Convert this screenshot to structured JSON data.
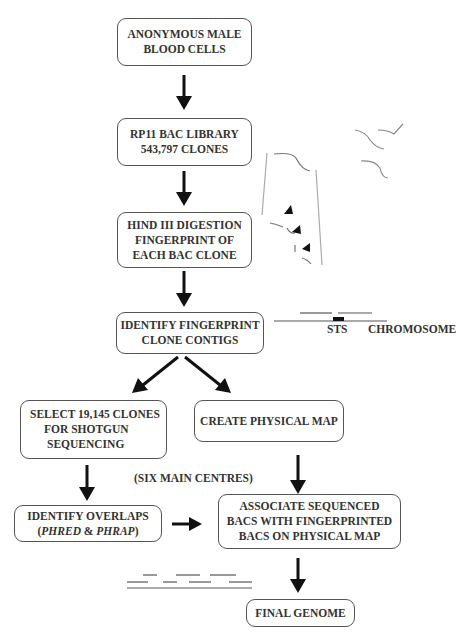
{
  "diagram": {
    "type": "flowchart",
    "title": "",
    "nodes": [
      {
        "id": "n1",
        "lines": [
          "ANONYMOUS MALE",
          "BLOOD CELLS"
        ]
      },
      {
        "id": "n2",
        "lines": [
          "RP11 BAC LIBRARY",
          "543,797 CLONES"
        ]
      },
      {
        "id": "n3",
        "lines": [
          "HIND III DIGESTION",
          "FINGERPRINT OF",
          "EACH BAC CLONE"
        ]
      },
      {
        "id": "n4",
        "lines": [
          "IDENTIFY FINGERPRINT",
          "CLONE CONTIGS"
        ]
      },
      {
        "id": "n5",
        "lines": [
          "SELECT 19,145 CLONES",
          "FOR SHOTGUN",
          "SEQUENCING"
        ]
      },
      {
        "id": "n6",
        "lines": [
          "CREATE PHYSICAL MAP"
        ]
      },
      {
        "id": "n7",
        "lines": [
          "IDENTIFY OVERLAPS",
          "(PHRED & PHRAP)"
        ],
        "italic_terms": [
          "PHRED",
          "PHRAP"
        ]
      },
      {
        "id": "n8",
        "lines": [
          "ASSOCIATE SEQUENCED",
          "BACS WITH FINGERPRINTED",
          "BACS ON PHYSICAL MAP"
        ]
      },
      {
        "id": "n9",
        "lines": [
          "FINAL GENOME"
        ]
      }
    ],
    "edges": [
      {
        "from": "n1",
        "to": "n2"
      },
      {
        "from": "n2",
        "to": "n3"
      },
      {
        "from": "n3",
        "to": "n4"
      },
      {
        "from": "n4",
        "to": "n5"
      },
      {
        "from": "n4",
        "to": "n6"
      },
      {
        "from": "n5",
        "to": "n7"
      },
      {
        "from": "n6",
        "to": "n8"
      },
      {
        "from": "n7",
        "to": "n8"
      },
      {
        "from": "n8",
        "to": "n9"
      }
    ],
    "annotations": {
      "six_centres": "(SIX MAIN CENTRES)",
      "sts": "STS",
      "chromosome": "CHROMOSOME",
      "overlap_open_paren": "(",
      "overlap_phred": "PHRED",
      "overlap_amp": " & ",
      "overlap_phrap": "PHRAP",
      "overlap_close_paren": ")"
    }
  }
}
